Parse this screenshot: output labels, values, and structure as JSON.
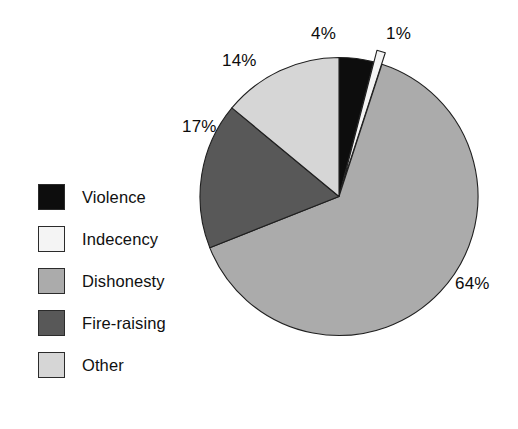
{
  "chart_data": {
    "type": "pie",
    "title": "",
    "subtitle": "",
    "xlabel": "",
    "ylabel": "",
    "legend_position": "left",
    "grid": false,
    "start_angle_deg": 0,
    "direction": "clockwise",
    "categories": [
      "Violence",
      "Indecency",
      "Dishonesty",
      "Fire-raising",
      "Other"
    ],
    "values": [
      4,
      1,
      64,
      17,
      14
    ],
    "unit": "%",
    "labels": [
      "4%",
      "1%",
      "64%",
      "17%",
      "14%"
    ],
    "colors": [
      "#0d0d0d",
      "#f4f4f4",
      "#ababab",
      "#585858",
      "#d6d6d6"
    ],
    "exploded": [
      "Indecency"
    ],
    "slices": [
      {
        "name": "Violence",
        "value": 4,
        "label": "4%",
        "color": "#0d0d0d",
        "exploded": false
      },
      {
        "name": "Indecency",
        "value": 1,
        "label": "1%",
        "color": "#f4f4f4",
        "exploded": true
      },
      {
        "name": "Dishonesty",
        "value": 64,
        "label": "64%",
        "color": "#ababab",
        "exploded": false
      },
      {
        "name": "Fire-raising",
        "value": 17,
        "label": "17%",
        "color": "#585858",
        "exploded": false
      },
      {
        "name": "Other",
        "value": 14,
        "label": "14%",
        "color": "#d6d6d6",
        "exploded": false
      }
    ]
  },
  "legend": {
    "items": [
      {
        "label": "Violence",
        "color": "#0d0d0d"
      },
      {
        "label": "Indecency",
        "color": "#f4f4f4"
      },
      {
        "label": "Dishonesty",
        "color": "#ababab"
      },
      {
        "label": "Fire-raising",
        "color": "#585858"
      },
      {
        "label": "Other",
        "color": "#d6d6d6"
      }
    ]
  },
  "value_labels": {
    "violence": "4%",
    "indecency": "1%",
    "other": "14%",
    "fire_raising": "17%",
    "dishonesty": "64%"
  }
}
